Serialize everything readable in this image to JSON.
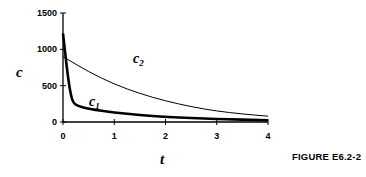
{
  "chart_data": {
    "type": "line",
    "title": "",
    "xlabel": "t",
    "ylabel": "c",
    "xlim": [
      0,
      4
    ],
    "ylim": [
      0,
      1500
    ],
    "x_ticks": [
      "0",
      "1",
      "2",
      "3",
      "4"
    ],
    "y_ticks": [
      "0",
      "500",
      "1000",
      "1500"
    ],
    "grid": false,
    "legend": "inline labels",
    "series": [
      {
        "name": "c1",
        "label": "c",
        "subscript": "1",
        "style": "thick",
        "x": [
          0,
          0.05,
          0.1,
          0.15,
          0.2,
          0.3,
          0.5,
          1,
          1.5,
          2,
          3,
          4
        ],
        "y": [
          1220,
          900,
          600,
          380,
          260,
          220,
          180,
          130,
          95,
          70,
          40,
          25
        ]
      },
      {
        "name": "c2",
        "label": "c",
        "subscript": "2",
        "style": "thin",
        "x": [
          0,
          0.5,
          1,
          1.5,
          2,
          2.5,
          3,
          3.5,
          4
        ],
        "y": [
          900,
          690,
          520,
          390,
          290,
          210,
          150,
          110,
          80
        ]
      }
    ]
  },
  "caption": "FIGURE E6.2-2"
}
